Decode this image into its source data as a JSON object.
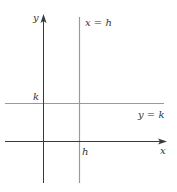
{
  "diagram": {
    "axes": {
      "x_label": "x",
      "y_label": "y",
      "axis_color": "#3a3a3a"
    },
    "lines": {
      "vertical": {
        "label": "x = h",
        "color": "#9a9a9a"
      },
      "horizontal": {
        "label": "y = k",
        "color": "#9a9a9a"
      }
    },
    "ticks": {
      "h_label": "h",
      "k_label": "k"
    }
  }
}
